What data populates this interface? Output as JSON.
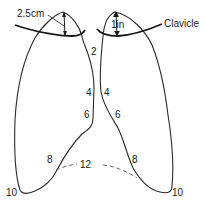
{
  "diagram": {
    "colors": {
      "line": "#2a2a2a",
      "dashed": "#555555",
      "text": "#222222"
    },
    "annotations": {
      "left_apex_height": "2.5cm",
      "right_apex_height": "1in",
      "clavicle": "Clavicle"
    },
    "rib_labels": {
      "left_lung": {
        "r2": "2",
        "r4": "4",
        "r6": "6",
        "r8": "8",
        "r10": "10"
      },
      "right_lung": {
        "r4": "4",
        "r6": "6",
        "r8": "8",
        "r10": "10"
      },
      "pleura_lower": "12"
    }
  }
}
